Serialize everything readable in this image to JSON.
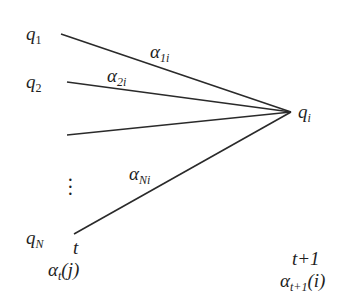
{
  "diagram": {
    "type": "hmm-forward-trellis",
    "source_states": [
      {
        "symbol": "q",
        "subscript": "1"
      },
      {
        "symbol": "q",
        "subscript": "2"
      },
      {
        "symbol": "",
        "subscript": ""
      },
      {
        "symbol": "⋮",
        "subscript": ""
      },
      {
        "symbol": "q",
        "subscript": "N"
      }
    ],
    "target_state": {
      "symbol": "q",
      "subscript": "i"
    },
    "edges": [
      {
        "from": "q_1",
        "to": "q_i",
        "label_symbol": "α",
        "label_sub": "1i"
      },
      {
        "from": "q_2",
        "to": "q_i",
        "label_symbol": "α",
        "label_sub": "2i"
      },
      {
        "from": "q_3",
        "to": "q_i",
        "label_symbol": "",
        "label_sub": ""
      },
      {
        "from": "q_N",
        "to": "q_i",
        "label_symbol": "α",
        "label_sub": "Ni"
      }
    ],
    "time_left": {
      "label": "t",
      "value_symbol": "α",
      "value_sub": "t",
      "value_arg": "(j)"
    },
    "time_right": {
      "label": "t+1",
      "value_symbol": "α",
      "value_sub": "t+1",
      "value_arg": "(i)"
    },
    "colors": {
      "line": "#2a2a2a",
      "text": "#1e1e1e",
      "background": "#ffffff"
    }
  }
}
